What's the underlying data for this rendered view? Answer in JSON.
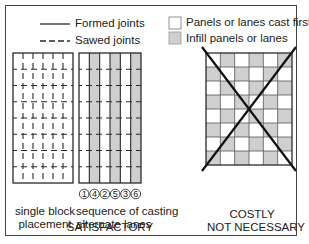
{
  "legend": {
    "formed_joints": "Formed joints",
    "sawed_joints": "Sawed joints",
    "cast_first": "Panels or lanes cast first",
    "infill": "Infill panels or lanes"
  },
  "colors": {
    "line": "#2a2a2a",
    "infill_fill": "#cfcfcf",
    "cast_first_fill": "#ffffff"
  },
  "panels": [
    {
      "id": "single-block",
      "caption_lines": [
        "single block",
        "placement"
      ],
      "grid": {
        "cols": 6,
        "rows": 8,
        "joint_style": "sawed"
      }
    },
    {
      "id": "alternate-lanes",
      "caption_lines": [
        "sequence of casting",
        "alternate lanes"
      ],
      "grid": {
        "cols": 6,
        "rows": 8,
        "shaded_lanes": [
          1,
          3,
          5
        ]
      },
      "sequence": [
        "1",
        "4",
        "2",
        "5",
        "3",
        "6"
      ]
    },
    {
      "id": "checkerboard",
      "caption_lines": [
        "COSTLY",
        "NOT NECESSARY"
      ],
      "grid": {
        "cols": 6,
        "rows": 8,
        "pattern": "checkerboard"
      },
      "crossed_out": true
    }
  ],
  "verdict_satisfactory": "SATISFACTORY"
}
